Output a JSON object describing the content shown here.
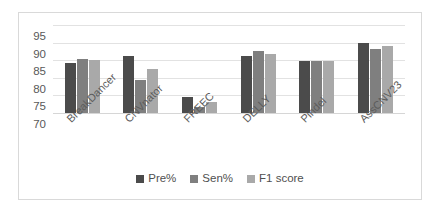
{
  "chart_data": {
    "type": "bar",
    "title": "",
    "subtitle": "",
    "xlabel": "",
    "ylabel": "",
    "ylim": [
      70,
      95
    ],
    "yticks": [
      70,
      75,
      80,
      85,
      90,
      95
    ],
    "grid": true,
    "legend_position": "bottom",
    "categories": [
      "BreakDancer",
      "CNVnator",
      "FREEC",
      "DELLY",
      "Pindel",
      "AssCNV23"
    ],
    "series": [
      {
        "name": "Pre%",
        "color": "#4b4b4b",
        "values": [
          84.3,
          86.2,
          74.5,
          86.1,
          84.9,
          89.8
        ]
      },
      {
        "name": "Sen%",
        "color": "#7f7f7f",
        "values": [
          85.3,
          79.5,
          71.8,
          87.7,
          84.8,
          88.2
        ]
      },
      {
        "name": "F1 score",
        "color": "#a9a9a9",
        "values": [
          85.0,
          82.6,
          73.1,
          86.9,
          84.7,
          89.0
        ]
      }
    ]
  },
  "axis": {
    "tick_labels": [
      "95",
      "90",
      "85",
      "80",
      "75",
      "70"
    ]
  },
  "legend": {
    "items": [
      {
        "label": "Pre%"
      },
      {
        "label": "Sen%"
      },
      {
        "label": "F1 score"
      }
    ]
  }
}
